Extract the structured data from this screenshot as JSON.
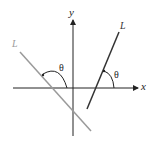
{
  "diagram": {
    "axes": {
      "x_label": "x",
      "y_label": "y"
    },
    "lines": [
      {
        "label": "L",
        "color": "#9a9a9a",
        "description": "line with negative slope"
      },
      {
        "label": "L",
        "color": "#333333",
        "description": "line with positive slope"
      }
    ],
    "angles": [
      {
        "label": "θ",
        "description": "obtuse angle between gray line L and positive x direction"
      },
      {
        "label": "θ",
        "description": "acute angle between dark line L and positive x direction"
      }
    ],
    "colors": {
      "axis": "#222222",
      "gray_line": "#9a9a9a",
      "dark_line": "#333333"
    }
  }
}
